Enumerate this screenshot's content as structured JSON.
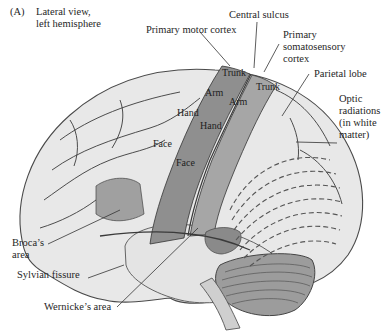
{
  "figure": {
    "panel_label": "(A)",
    "view_label_line1": "Lateral view,",
    "view_label_line2": "left hemisphere"
  },
  "labels": {
    "central_sulcus": "Central sulcus",
    "primary_motor_cortex": "Primary motor cortex",
    "primary_somatosensory_line1": "Primary",
    "primary_somatosensory_line2": "somatosensory",
    "primary_somatosensory_line3": "cortex",
    "parietal_lobe": "Parietal lobe",
    "optic_line1": "Optic",
    "optic_line2": "radiations",
    "optic_line3": "(in white",
    "optic_line4": "matter)",
    "broca_line1": "Broca’s",
    "broca_line2": "area",
    "sylvian_fissure": "Sylvian fissure",
    "wernicke": "Wernicke’s area"
  },
  "body_map": {
    "motor": [
      "Trunk",
      "Arm",
      "Hand",
      "Face"
    ],
    "sensory": [
      "Trunk",
      "Arm",
      "Hand",
      "Face"
    ]
  },
  "colors": {
    "brain_light": "#e9e9e9",
    "cortex_shaded": "#8f8f8f",
    "cortex_shaded_light": "#a8a8a8",
    "sulcus_line": "#3a3a3a",
    "optic_dash": "#5a5a5a",
    "cerebellum": "#9a9a9a"
  }
}
